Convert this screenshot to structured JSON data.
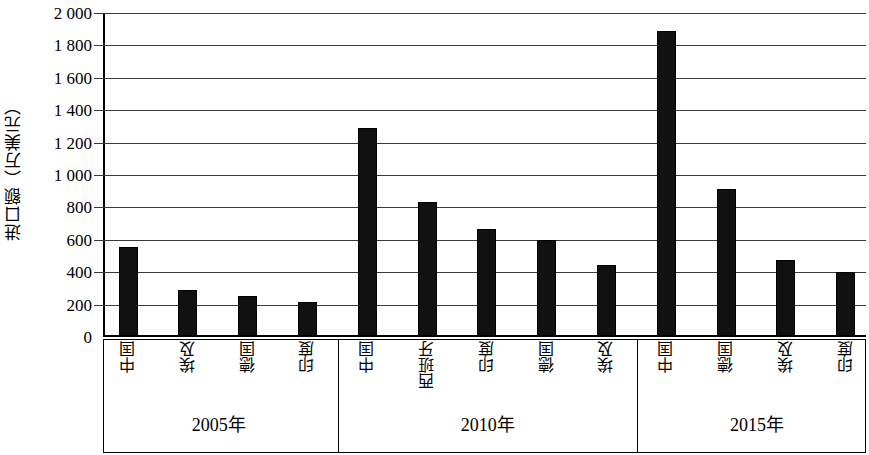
{
  "chart_data": {
    "type": "bar",
    "title": "",
    "xlabel": "",
    "ylabel": "进口额（万美元）",
    "ylim": [
      0,
      2000
    ],
    "ytick_step": 200,
    "ytick_labels": [
      "2 000",
      "1 800",
      "1 600",
      "1 400",
      "1 200",
      "1 000",
      "800",
      "600",
      "400",
      "200",
      "0"
    ],
    "ytick_values": [
      2000,
      1800,
      1600,
      1400,
      1200,
      1000,
      800,
      600,
      400,
      200,
      0
    ],
    "grid": true,
    "legend": "none",
    "bar_color": "#111111",
    "groups": [
      {
        "label": "2005年",
        "categories": [
          "中国",
          "埃及",
          "德国",
          "印度"
        ],
        "values": [
          550,
          285,
          245,
          210
        ]
      },
      {
        "label": "2010年",
        "categories": [
          "中国",
          "西班牙",
          "印度",
          "德国",
          "埃及"
        ],
        "values": [
          1285,
          825,
          660,
          595,
          440
        ]
      },
      {
        "label": "2015年",
        "categories": [
          "中国",
          "德国",
          "埃及",
          "印度"
        ],
        "values": [
          1880,
          910,
          470,
          395
        ]
      }
    ],
    "categories": [
      "中国",
      "埃及",
      "德国",
      "印度",
      "中国",
      "西班牙",
      "印度",
      "德国",
      "埃及",
      "中国",
      "德国",
      "埃及",
      "印度"
    ],
    "values": [
      550,
      285,
      245,
      210,
      1285,
      825,
      660,
      595,
      440,
      1880,
      910,
      470,
      395
    ]
  }
}
